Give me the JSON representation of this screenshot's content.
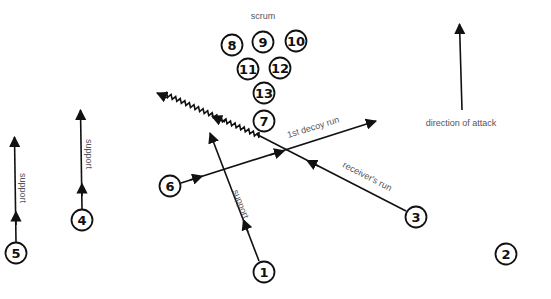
{
  "diagram": {
    "title": "scrum",
    "direction_label": "direction of attack",
    "colors": {
      "ink": "#111111",
      "label": "#555555",
      "background": "#ffffff"
    },
    "players": [
      {
        "number": "8",
        "x": 232,
        "y": 45
      },
      {
        "number": "9",
        "x": 263,
        "y": 42
      },
      {
        "number": "10",
        "x": 296,
        "y": 41
      },
      {
        "number": "11",
        "x": 248,
        "y": 69
      },
      {
        "number": "12",
        "x": 280,
        "y": 68
      },
      {
        "number": "13",
        "x": 264,
        "y": 93
      },
      {
        "number": "7",
        "x": 264,
        "y": 121
      },
      {
        "number": "6",
        "x": 170,
        "y": 186
      },
      {
        "number": "4",
        "x": 82,
        "y": 220
      },
      {
        "number": "5",
        "x": 16,
        "y": 253
      },
      {
        "number": "1",
        "x": 264,
        "y": 272
      },
      {
        "number": "3",
        "x": 416,
        "y": 217
      },
      {
        "number": "2",
        "x": 506,
        "y": 254
      }
    ],
    "runs": [
      {
        "id": "pass",
        "type": "pass (wavy)",
        "from": "7",
        "label": ""
      },
      {
        "id": "decoy",
        "from": "6",
        "label": "1st decoy run"
      },
      {
        "id": "receiver",
        "from": "3",
        "label": "receiver's run"
      },
      {
        "id": "support-1",
        "from": "1",
        "label": "support"
      },
      {
        "id": "support-4",
        "from": "4",
        "label": "support"
      },
      {
        "id": "support-5",
        "from": "5",
        "label": "support"
      }
    ]
  }
}
